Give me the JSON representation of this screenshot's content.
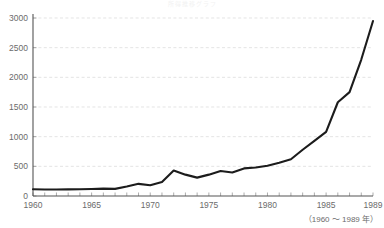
{
  "title_faint": "所得推移グラフ",
  "caption": "（1960 ～ 1989 年）",
  "colors": {
    "line": "#1c1c1c",
    "grid": "#d8d8d8",
    "axis": "#555555",
    "tick_text": "#6b6b6b",
    "background": "#ffffff"
  },
  "chart_data": {
    "type": "line",
    "title": "",
    "xlabel": "",
    "ylabel": "",
    "xlim": [
      1960,
      1989
    ],
    "ylim": [
      0,
      3000
    ],
    "grid": true,
    "legend": "none",
    "ytick_labels": [
      "0",
      "500",
      "1000",
      "1500",
      "2000",
      "2500",
      "3000"
    ],
    "ytick_values": [
      0,
      500,
      1000,
      1500,
      2000,
      2500,
      3000
    ],
    "xtick_labels": [
      "1960",
      "1965",
      "1970",
      "1975",
      "1980",
      "1985",
      "1989"
    ],
    "xtick_values": [
      1960,
      1965,
      1970,
      1975,
      1980,
      1985,
      1989
    ],
    "annotations": [
      "（1960 ～ 1989 年）"
    ],
    "x": [
      1960,
      1961,
      1962,
      1963,
      1964,
      1965,
      1966,
      1967,
      1968,
      1969,
      1970,
      1971,
      1972,
      1973,
      1974,
      1975,
      1976,
      1977,
      1978,
      1979,
      1980,
      1981,
      1982,
      1983,
      1984,
      1985,
      1986,
      1987,
      1988,
      1989
    ],
    "values": [
      115,
      110,
      110,
      112,
      115,
      118,
      125,
      120,
      160,
      205,
      180,
      235,
      430,
      360,
      310,
      360,
      420,
      395,
      465,
      480,
      510,
      560,
      620,
      780,
      930,
      1080,
      1580,
      1750,
      2300,
      2950
    ],
    "series": [
      {
        "name": "series-1",
        "values": [
          115,
          110,
          110,
          112,
          115,
          118,
          125,
          120,
          160,
          205,
          180,
          235,
          430,
          360,
          310,
          360,
          420,
          395,
          465,
          480,
          510,
          560,
          620,
          780,
          930,
          1080,
          1580,
          1750,
          2300,
          2950
        ]
      }
    ]
  }
}
